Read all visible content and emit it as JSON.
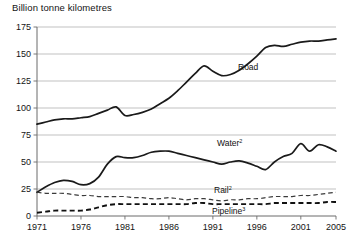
{
  "chart_data": {
    "type": "line",
    "title": "Billion tonne kilometres",
    "xlabel": "",
    "ylabel": "",
    "ylim": [
      0,
      175
    ],
    "xlim": [
      1971,
      2005
    ],
    "yticks": [
      0,
      25,
      50,
      75,
      100,
      125,
      150,
      175
    ],
    "xticks": [
      1971,
      1976,
      1981,
      1986,
      1991,
      1996,
      2001,
      2005
    ],
    "grid": true,
    "legend_position": "inline-annotations",
    "x": [
      1971,
      1972,
      1973,
      1974,
      1975,
      1976,
      1977,
      1978,
      1979,
      1980,
      1981,
      1982,
      1983,
      1984,
      1985,
      1986,
      1987,
      1988,
      1989,
      1990,
      1991,
      1992,
      1993,
      1994,
      1995,
      1996,
      1997,
      1998,
      1999,
      2000,
      2001,
      2002,
      2003,
      2004,
      2005
    ],
    "series": [
      {
        "name": "Road",
        "style": "solid",
        "weight": "thick",
        "color": "#1a1a1a",
        "label": "Road",
        "superscript": "",
        "values": [
          85,
          87,
          89,
          90,
          90,
          91,
          92,
          95,
          98,
          101,
          93,
          94,
          96,
          99,
          104,
          109,
          116,
          124,
          132,
          139,
          134,
          130,
          131,
          135,
          141,
          148,
          156,
          158,
          157,
          159,
          161,
          162,
          162,
          163,
          164
        ]
      },
      {
        "name": "Water",
        "style": "solid",
        "weight": "thick",
        "color": "#1a1a1a",
        "label": "Water",
        "superscript": "2",
        "values": [
          22,
          27,
          31,
          33,
          32,
          29,
          30,
          36,
          48,
          55,
          54,
          54,
          56,
          59,
          60,
          60,
          58,
          56,
          54,
          52,
          50,
          48,
          50,
          51,
          49,
          46,
          43,
          50,
          55,
          58,
          67,
          60,
          66,
          64,
          60
        ]
      },
      {
        "name": "Rail",
        "style": "dashed",
        "weight": "thin",
        "color": "#3a3a3a",
        "label": "Rail",
        "superscript": "2",
        "values": [
          22,
          21,
          21,
          21,
          20,
          19,
          19,
          18,
          18,
          18,
          18,
          17,
          17,
          16,
          16,
          17,
          16,
          15,
          16,
          16,
          15,
          14,
          15,
          15,
          16,
          16,
          17,
          18,
          18,
          18,
          19,
          19,
          20,
          21,
          22
        ]
      },
      {
        "name": "Pipeline",
        "style": "dashed",
        "weight": "bold",
        "color": "#111111",
        "label": "Pipeline",
        "superscript": "3",
        "values": [
          3,
          4,
          5,
          5,
          5,
          5,
          6,
          8,
          10,
          11,
          11,
          11,
          11,
          11,
          11,
          11,
          11,
          11,
          12,
          12,
          11,
          11,
          11,
          11,
          11,
          11,
          11,
          12,
          12,
          12,
          12,
          12,
          12,
          13,
          13
        ]
      }
    ],
    "annotations": [
      {
        "text": "Road",
        "superscript": "",
        "x_px": 238,
        "y_px": 70
      },
      {
        "text": "Water",
        "superscript": "2",
        "x_px": 217,
        "y_px": 146
      },
      {
        "text": "Rail",
        "superscript": "2",
        "x_px": 214,
        "y_px": 193
      },
      {
        "text": "Pipeline",
        "superscript": "3",
        "x_px": 212,
        "y_px": 214
      }
    ]
  }
}
